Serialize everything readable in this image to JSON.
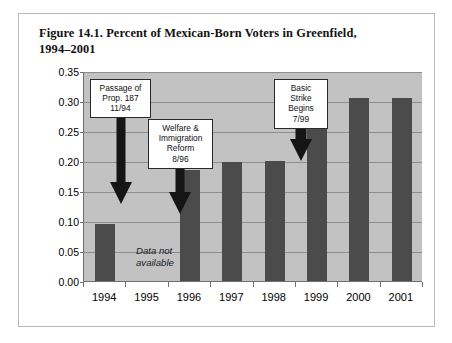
{
  "figure": {
    "title": "Figure 14.1. Percent of Mexican-Born Voters in Greenfield, 1994–2001",
    "border_color": "#b9b9b9"
  },
  "chart_data": {
    "type": "bar",
    "title": "Figure 14.1. Percent of Mexican-Born Voters in Greenfield, 1994–2001",
    "xlabel": "",
    "ylabel": "",
    "categories": [
      "1994",
      "1995",
      "1996",
      "1997",
      "1998",
      "1999",
      "2000",
      "2001"
    ],
    "values": [
      0.095,
      null,
      0.185,
      0.198,
      0.2,
      0.283,
      0.305,
      0.305
    ],
    "ylim": [
      0.0,
      0.35
    ],
    "ytick_labels": [
      "0.00",
      "0.05",
      "0.10",
      "0.15",
      "0.20",
      "0.25",
      "0.30",
      "0.35"
    ],
    "ytick_values": [
      0.0,
      0.05,
      0.1,
      0.15,
      0.2,
      0.25,
      0.3,
      0.35
    ],
    "grid": true,
    "legend": null,
    "bar_color": "#4b4b4b",
    "plot_background": "#c2c2c2",
    "missing_data_note": "Data not\navailable",
    "missing_data_category": "1995",
    "annotations": [
      {
        "id": "prop-187",
        "text": "Passage of\nProp. 187\n11/94",
        "points_to_category": "1994"
      },
      {
        "id": "welfare-immigration-reform",
        "text": "Welfare &\nImmigration\nReform\n8/96",
        "points_to_category": "1995"
      },
      {
        "id": "basic-strike",
        "text": "Basic\nStrike\nBegins\n7/99",
        "points_to_category": "1999"
      }
    ]
  }
}
